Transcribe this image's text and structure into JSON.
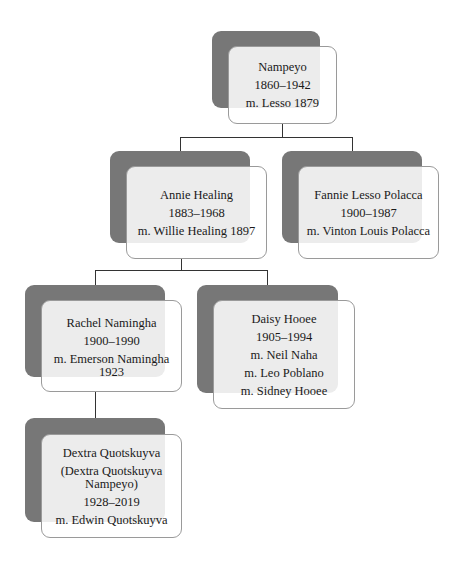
{
  "diagram": {
    "type": "family-tree",
    "colors": {
      "back_box": "#777777",
      "card_fill": "#eeeeee",
      "card_border": "#9a9a9a",
      "connector": "#333333",
      "text": "#1a1a1a"
    },
    "nodes": {
      "nampeyo": {
        "name": "Nampeyo",
        "years": "1860–1942",
        "marriages": [
          "m. Lesso 1879"
        ]
      },
      "annie": {
        "name": "Annie Healing",
        "years": "1883–1968",
        "marriages": [
          "m. Willie Healing 1897"
        ]
      },
      "fannie": {
        "name": "Fannie Lesso Polacca",
        "years": "1900–1987",
        "marriages": [
          "m. Vinton Louis Polacca"
        ]
      },
      "rachel": {
        "name": "Rachel Namingha",
        "years": "1900–1990",
        "marriages": [
          "m. Emerson Namingha",
          "1923"
        ]
      },
      "daisy": {
        "name": "Daisy Hooee",
        "years": "1905–1994",
        "marriages": [
          "m. Neil Naha",
          "m. Leo Poblano",
          "m. Sidney Hooee"
        ]
      },
      "dextra": {
        "name": "Dextra Quotskuyva",
        "alt_name": [
          "(Dextra Quotskuyva",
          "Nampeyo)"
        ],
        "years": "1928–2019",
        "marriages": [
          "m. Edwin Quotskuyva"
        ]
      }
    },
    "edges": [
      {
        "from": "nampeyo",
        "to": "annie"
      },
      {
        "from": "nampeyo",
        "to": "fannie"
      },
      {
        "from": "annie",
        "to": "rachel"
      },
      {
        "from": "annie",
        "to": "daisy"
      },
      {
        "from": "rachel",
        "to": "dextra"
      }
    ]
  }
}
